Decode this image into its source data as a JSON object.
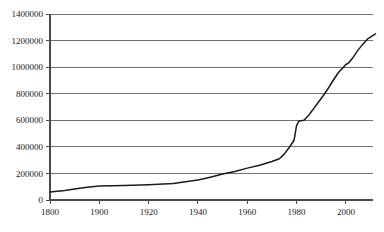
{
  "chart_data": {
    "type": "line",
    "title": "",
    "subtitle": "",
    "xlabel": "",
    "ylabel": "",
    "grid": true,
    "legend": false,
    "legend_position": "none",
    "xlim": [
      1800,
      2012
    ],
    "ylim": [
      0,
      1400000
    ],
    "x_tick_labels": [
      "1800",
      "1900",
      "1920",
      "1940",
      "1960",
      "1980",
      "2000"
    ],
    "x_tick_values": [
      1800,
      1900,
      1920,
      1940,
      1960,
      1980,
      2000
    ],
    "y_tick_labels": [
      "0",
      "200000",
      "400000",
      "600000",
      "800000",
      "1000000",
      "1200000",
      "1400000"
    ],
    "y_tick_values": [
      0,
      200000,
      400000,
      600000,
      800000,
      1000000,
      1200000,
      1400000
    ],
    "axis_note": "x axis spacing is non-uniform: the 1800-1900 interval occupies the same width as each later 20-year interval",
    "series": [
      {
        "name": "series-1",
        "color": "#1a1a1a",
        "x": [
          1800,
          1830,
          1860,
          1880,
          1900,
          1910,
          1920,
          1930,
          1940,
          1945,
          1950,
          1955,
          1960,
          1965,
          1970,
          1973,
          1975,
          1977,
          1979,
          1980,
          1981,
          1983,
          1985,
          1987,
          1989,
          1991,
          1993,
          1995,
          1997,
          1999,
          2000,
          2001,
          2003,
          2005,
          2007,
          2009,
          2012
        ],
        "y": [
          60000,
          72000,
          88000,
          98000,
          105000,
          110000,
          115000,
          124000,
          150000,
          172000,
          195000,
          215000,
          240000,
          262000,
          290000,
          310000,
          345000,
          395000,
          450000,
          560000,
          595000,
          600000,
          640000,
          690000,
          740000,
          790000,
          845000,
          905000,
          960000,
          1000000,
          1020000,
          1030000,
          1075000,
          1130000,
          1175000,
          1215000,
          1250000
        ]
      }
    ]
  },
  "plot_geometry": {
    "plot_left": 50,
    "plot_right": 373,
    "plot_top": 14,
    "plot_bottom": 200
  },
  "colors": {
    "background": "#ffffff",
    "gridline": "#6f6f6f",
    "axis": "#4a4a4a",
    "series": "#1a1a1a",
    "text": "#1a1a1a"
  }
}
